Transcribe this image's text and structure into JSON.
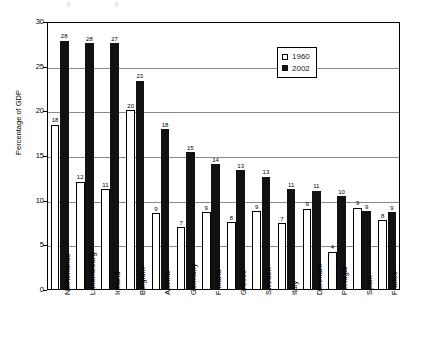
{
  "chart_data": {
    "type": "bar",
    "title": "",
    "subtitle": "",
    "xlabel": "",
    "ylabel": "Percentage of GDP",
    "ylim": [
      0,
      30
    ],
    "ytick_labels": [
      "0",
      "5",
      "10",
      "15",
      "20",
      "25",
      "30"
    ],
    "ytick_values": [
      0,
      5,
      10,
      15,
      20,
      25,
      30
    ],
    "grid": true,
    "grid_axis": "y",
    "legend_position": "top-right-inside",
    "categories": [
      "Netherlands",
      "Luxembourg",
      "Ireland",
      "Belgium",
      "Austria",
      "Germany",
      "Finland",
      "Greece",
      "Sweden",
      "Italy",
      "Denmark",
      "Portugal",
      "Spain",
      "France"
    ],
    "series": [
      {
        "name": "1960",
        "color": "#ffffff",
        "edge_color": "#000000",
        "values": [
          18,
          12,
          11,
          20,
          9,
          7,
          9,
          8,
          9,
          7,
          9,
          4,
          9,
          8
        ],
        "plotted_values": [
          18.5,
          12.1,
          11.3,
          20.1,
          8.6,
          7.0,
          8.7,
          7.6,
          8.8,
          7.5,
          9.1,
          4.3,
          9.2,
          7.8
        ],
        "labels": [
          "18",
          "12",
          "11",
          "20",
          "9",
          "7",
          "9",
          "8",
          "9",
          "7",
          "9",
          "4",
          "9",
          "8"
        ]
      },
      {
        "name": "2002",
        "color": "#111111",
        "edge_color": "#111111",
        "values": [
          28,
          28,
          27,
          23,
          18,
          15,
          14,
          13,
          13,
          11,
          11,
          10,
          9,
          9
        ],
        "plotted_values": [
          27.9,
          27.6,
          27.6,
          23.4,
          18.0,
          15.4,
          14.1,
          13.4,
          12.7,
          11.3,
          11.1,
          10.5,
          8.8,
          8.7
        ],
        "labels": [
          "28",
          "28",
          "27",
          "23",
          "18",
          "15",
          "14",
          "13",
          "13",
          "11",
          "11",
          "10",
          "9",
          "9"
        ]
      }
    ]
  },
  "legend": {
    "items": [
      {
        "label": "1960",
        "swatch": "white-square"
      },
      {
        "label": "2002",
        "swatch": "black-square"
      }
    ]
  }
}
